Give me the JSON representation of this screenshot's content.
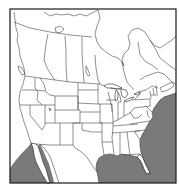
{
  "map": {
    "type": "range-map",
    "region": "North America",
    "width": 179,
    "height": 184,
    "frame": {
      "x": 10,
      "y": 9,
      "width": 166,
      "height": 174
    },
    "colors": {
      "background": "#ffffff",
      "land": "#ffffff",
      "boundary_lines": "#222222",
      "shaded_range": "#7a7a7a",
      "frame": "#1a1a1a"
    },
    "shaded_regions": [
      {
        "name": "western-atlantic",
        "description": "Atlantic Ocean off the eastern US coast, from roughly New England south to Florida"
      },
      {
        "name": "gulf-of-mexico",
        "description": "Gulf of Mexico"
      },
      {
        "name": "eastern-pacific",
        "description": "Pacific Ocean off Baja California / southwestern Mexico"
      },
      {
        "name": "gulf-of-california",
        "description": "Gulf of California"
      }
    ],
    "features": [
      "US state boundaries",
      "Canadian province boundaries",
      "Mexico",
      "Great Lakes",
      "Hudson Bay"
    ]
  }
}
